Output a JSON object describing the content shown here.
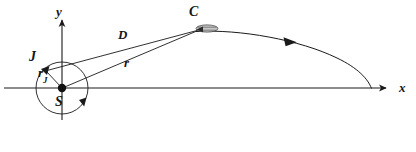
{
  "figure": {
    "background_color": "#ffffff",
    "stroke_color": "#1a1a1a",
    "label_color": "#151515",
    "body_fill_color": "#c8c8c8",
    "width": 416,
    "height": 152
  },
  "axes": {
    "x_label": "x",
    "y_label": "y",
    "origin_label": "S",
    "x_axis_start": [
      4,
      88
    ],
    "x_axis_end": [
      392,
      88
    ],
    "y_axis_start": [
      62,
      120
    ],
    "y_axis_end": [
      62,
      14
    ]
  },
  "points": {
    "sun": {
      "label": "S",
      "x": 62,
      "y": 88,
      "marker": "filled-dot",
      "label_dx": -5,
      "label_dy": 8
    },
    "jupiter": {
      "label": "J",
      "x": 44,
      "y": 70,
      "marker": "arrowhead",
      "label_dx": -13,
      "label_dy": -22
    },
    "spacecraft": {
      "label": "C",
      "x": 198,
      "y": 30,
      "marker": "spacecraft-body",
      "label_dx": -8,
      "label_dy": -24
    }
  },
  "segments": {
    "jupiter_orbit_radius": {
      "label": "r",
      "subscript": "J",
      "from": "S",
      "to": "J",
      "label_x": 39,
      "label_y": 74
    },
    "jupiter_to_craft": {
      "label": "D",
      "subscript": "",
      "from": "J",
      "to": "C",
      "label_x": 122,
      "label_y": 36
    },
    "sun_to_craft": {
      "label": "r",
      "subscript": "",
      "from": "S",
      "to": "C",
      "label_x": 127,
      "label_y": 64
    }
  },
  "orbit": {
    "name": "jupiter-circular-orbit",
    "center": [
      62,
      88
    ],
    "radius": 26,
    "direction": "counterclockwise",
    "direction_arrow_at": [
      84,
      104
    ]
  },
  "trajectory": {
    "name": "spacecraft-hyperbolic-trajectory",
    "direction": "inbound-toward-jupiter",
    "direction_arrow_at": [
      290,
      41
    ],
    "start": [
      198,
      30
    ],
    "end": [
      370,
      88
    ]
  }
}
